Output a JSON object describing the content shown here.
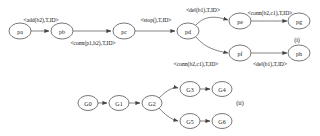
{
  "figure": {
    "title": "",
    "panels": [
      {
        "id": "panel-i",
        "caption": "(i)",
        "caption_x": 297,
        "caption_y": 40,
        "nodes": [
          {
            "id": "pa",
            "label": "pa",
            "x": 20,
            "y": 31,
            "rx": 11,
            "ry": 8
          },
          {
            "id": "pb",
            "label": "pb",
            "x": 62,
            "y": 31,
            "rx": 11,
            "ry": 8
          },
          {
            "id": "pc",
            "label": "pc",
            "x": 124,
            "y": 31,
            "rx": 11,
            "ry": 8
          },
          {
            "id": "pd",
            "label": "pd",
            "x": 188,
            "y": 31,
            "rx": 11,
            "ry": 8
          },
          {
            "id": "pe",
            "label": "pe",
            "x": 240,
            "y": 21,
            "rx": 11,
            "ry": 8
          },
          {
            "id": "pg",
            "label": "pg",
            "x": 299,
            "y": 21,
            "rx": 11,
            "ry": 8
          },
          {
            "id": "pf",
            "label": "pf",
            "x": 240,
            "y": 53,
            "rx": 11,
            "ry": 8
          },
          {
            "id": "ph",
            "label": "ph",
            "x": 299,
            "y": 53,
            "rx": 11,
            "ry": 8
          }
        ],
        "edges": [
          {
            "id": "pa-pb",
            "from": "pa",
            "to": "pb",
            "label": "<add(b2),T,ID>",
            "label_x": 41,
            "label_y": 20,
            "path": "M31,31 L49,31"
          },
          {
            "id": "pb-pc",
            "from": "pb",
            "to": "pc",
            "label": "<conn(p1,b2),T,ID>",
            "label_x": 93,
            "label_y": 43,
            "path": "M73,31 L111,31"
          },
          {
            "id": "pc-pd",
            "from": "pc",
            "to": "pd",
            "label": "<stop(),T,ID>",
            "label_x": 156,
            "label_y": 20,
            "path": "M135,31 L175,31"
          },
          {
            "id": "pd-pe",
            "from": "pd",
            "to": "pe",
            "label": "<del(b1),T,ID>",
            "label_x": 203,
            "label_y": 10,
            "path": "M196,25 C206,14 218,17 228,20"
          },
          {
            "id": "pe-pg",
            "from": "pe",
            "to": "pg",
            "label": "<conn(b2,c1),T,ID>",
            "label_x": 270,
            "label_y": 13,
            "path": "M251,21 L287,21"
          },
          {
            "id": "pd-pf",
            "from": "pd",
            "to": "pf",
            "label": "<conn(b2,c1),T,ID>",
            "label_x": 196,
            "label_y": 64,
            "path": "M196,37 C206,49 218,51 228,53"
          },
          {
            "id": "pf-ph",
            "from": "pf",
            "to": "ph",
            "label": "<del(b1),T,ID>",
            "label_x": 270,
            "label_y": 64,
            "path": "M251,53 L287,53"
          }
        ]
      },
      {
        "id": "panel-ii",
        "caption": "(ii)",
        "caption_x": 240,
        "caption_y": 103,
        "nodes": [
          {
            "id": "G0",
            "label": "G0",
            "x": 88,
            "y": 103,
            "rx": 10,
            "ry": 7.5
          },
          {
            "id": "G1",
            "label": "G1",
            "x": 119,
            "y": 103,
            "rx": 10,
            "ry": 7.5
          },
          {
            "id": "G2",
            "label": "G2",
            "x": 152,
            "y": 103,
            "rx": 10,
            "ry": 7.5
          },
          {
            "id": "G3",
            "label": "G3",
            "x": 190,
            "y": 89,
            "rx": 10,
            "ry": 7.5
          },
          {
            "id": "G4",
            "label": "G4",
            "x": 222,
            "y": 89,
            "rx": 10,
            "ry": 7.5
          },
          {
            "id": "G5",
            "label": "G5",
            "x": 190,
            "y": 121,
            "rx": 10,
            "ry": 7.5
          },
          {
            "id": "G6",
            "label": "G6",
            "x": 222,
            "y": 121,
            "rx": 10,
            "ry": 7.5
          }
        ],
        "edges": [
          {
            "id": "G0-G1",
            "from": "G0",
            "to": "G1",
            "label": "",
            "label_x": 0,
            "label_y": 0,
            "path": "M98,103 L107,103"
          },
          {
            "id": "G1-G2",
            "from": "G1",
            "to": "G2",
            "label": "",
            "label_x": 0,
            "label_y": 0,
            "path": "M129,103 L140,103"
          },
          {
            "id": "G2-G3",
            "from": "G2",
            "to": "G3",
            "label": "",
            "label_x": 0,
            "label_y": 0,
            "path": "M159,98 C168,89 174,87 178,88"
          },
          {
            "id": "G3-G4",
            "from": "G3",
            "to": "G4",
            "label": "",
            "label_x": 0,
            "label_y": 0,
            "path": "M200,89 L210,89"
          },
          {
            "id": "G2-G5",
            "from": "G2",
            "to": "G5",
            "label": "",
            "label_x": 0,
            "label_y": 0,
            "path": "M159,108 C168,118 174,120 178,121"
          },
          {
            "id": "G5-G6",
            "from": "G5",
            "to": "G6",
            "label": "",
            "label_x": 0,
            "label_y": 0,
            "path": "M200,121 L210,121"
          }
        ]
      }
    ],
    "colors": {
      "node_stroke": "#555555",
      "node_fill": "#ffffff",
      "edge_stroke": "#666666",
      "text": "#111111",
      "background": "#ffffff"
    }
  }
}
